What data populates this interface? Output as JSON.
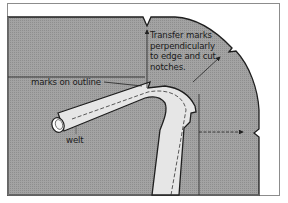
{
  "diagram": {
    "labels": {
      "marks_on_outline": "marks on outline",
      "transfer_note": "Transfer marks\nperpendicularly\nto edge and cut\nnotches.",
      "welt": "welt"
    },
    "colors": {
      "frame_border": "#8c8c8c",
      "fabric_fill": "#9b9b9b",
      "welt_fill": "#e6e6e6",
      "outline_stroke": "#1e1e1e",
      "background": "#ffffff"
    },
    "elements": [
      "frame",
      "fabric-piece",
      "top-notch",
      "side-notch",
      "corner-notch",
      "welt-strip",
      "welt-stitch-line",
      "welt-end",
      "transfer-arrow-up",
      "transfer-arrow-diagonal",
      "transfer-arrow-right",
      "marks-on-outline-leader",
      "placement-guide-line"
    ]
  }
}
